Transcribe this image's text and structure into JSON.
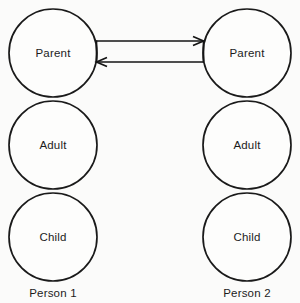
{
  "diagram": {
    "type": "complementary-transaction",
    "accent_color": "#141414",
    "background_color": "#fbfbfa",
    "persons": [
      {
        "id": "person-1",
        "label": "Person 1",
        "label_x": 53,
        "label_y": 297,
        "ego_states": [
          {
            "id": "parent",
            "label": "Parent",
            "cx": 53,
            "cy": 53,
            "r": 44
          },
          {
            "id": "adult",
            "label": "Adult",
            "cx": 53,
            "cy": 145,
            "r": 44
          },
          {
            "id": "child",
            "label": "Child",
            "cx": 53,
            "cy": 237,
            "r": 44
          }
        ]
      },
      {
        "id": "person-2",
        "label": "Person 2",
        "label_x": 247,
        "label_y": 297,
        "ego_states": [
          {
            "id": "parent",
            "label": "Parent",
            "cx": 247,
            "cy": 53,
            "r": 44
          },
          {
            "id": "adult",
            "label": "Adult",
            "cx": 247,
            "cy": 145,
            "r": 44
          },
          {
            "id": "child",
            "label": "Child",
            "cx": 247,
            "cy": 237,
            "r": 44
          }
        ]
      }
    ],
    "transactions": [
      {
        "id": "stimulus",
        "direction": "right",
        "from": "person-1-parent",
        "to": "person-2-parent",
        "x1": 96,
        "x2": 204,
        "y": 41
      },
      {
        "id": "response",
        "direction": "left",
        "from": "person-2-parent",
        "to": "person-1-parent",
        "x1": 204,
        "x2": 96,
        "y": 62
      }
    ],
    "connectors": [
      {
        "id": "left-connector",
        "x": 96,
        "y1": 41,
        "y2": 62
      },
      {
        "id": "right-connector",
        "x": 204,
        "y1": 41,
        "y2": 62
      }
    ]
  }
}
